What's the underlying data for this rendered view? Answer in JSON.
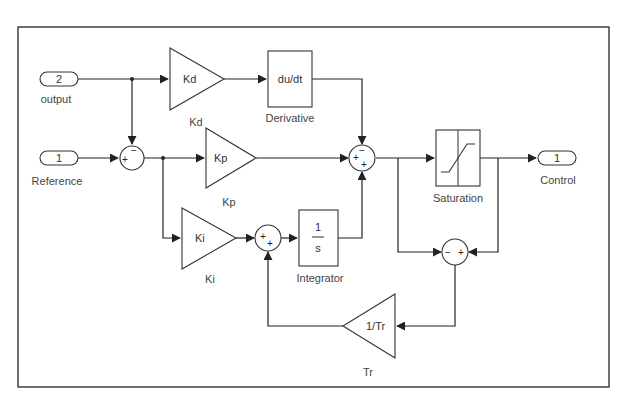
{
  "diagram": {
    "type": "simulink-block-diagram",
    "inports": [
      {
        "id": "in2",
        "number": "2",
        "label": "output"
      },
      {
        "id": "in1",
        "number": "1",
        "label": "Reference"
      }
    ],
    "outports": [
      {
        "id": "out1",
        "number": "1",
        "label": "Control"
      }
    ],
    "gains": {
      "kd": {
        "symbol": "Kd",
        "label": "Kd"
      },
      "kp": {
        "symbol": "Kp",
        "label": "Kp"
      },
      "ki": {
        "symbol": "Ki",
        "label": "Ki"
      },
      "tr": {
        "symbol": "1/Tr",
        "label": "Tr"
      }
    },
    "blocks": {
      "derivative": {
        "content": "du/dt",
        "label": "Derivative"
      },
      "integrator": {
        "numerator": "1",
        "denominator": "s",
        "label": "Integrator"
      },
      "saturation": {
        "label": "Saturation"
      }
    },
    "sums": {
      "error_sum": {
        "signs": [
          "+",
          "−"
        ]
      },
      "pid_sum": {
        "signs": [
          "−",
          "+",
          "+"
        ]
      },
      "integ_sum": {
        "signs": [
          "+",
          "+"
        ]
      },
      "windup_sum": {
        "signs": [
          "−",
          "+"
        ]
      }
    },
    "connections": [
      "output -> error_sum (−)",
      "output -> Kd -> Derivative -> pid_sum (−)",
      "Reference -> error_sum (+)",
      "error_sum -> Kp -> pid_sum (+)",
      "error_sum -> Ki -> integ_sum (+)",
      "integ_sum -> Integrator -> pid_sum (+)",
      "pid_sum -> Saturation -> Control",
      "pid_sum -> windup_sum (−)",
      "Saturation -> windup_sum (+)",
      "windup_sum -> 1/Tr -> integ_sum (+)"
    ]
  },
  "colors": {
    "line": "#222222",
    "text": "#333333",
    "background": "#ffffff"
  }
}
